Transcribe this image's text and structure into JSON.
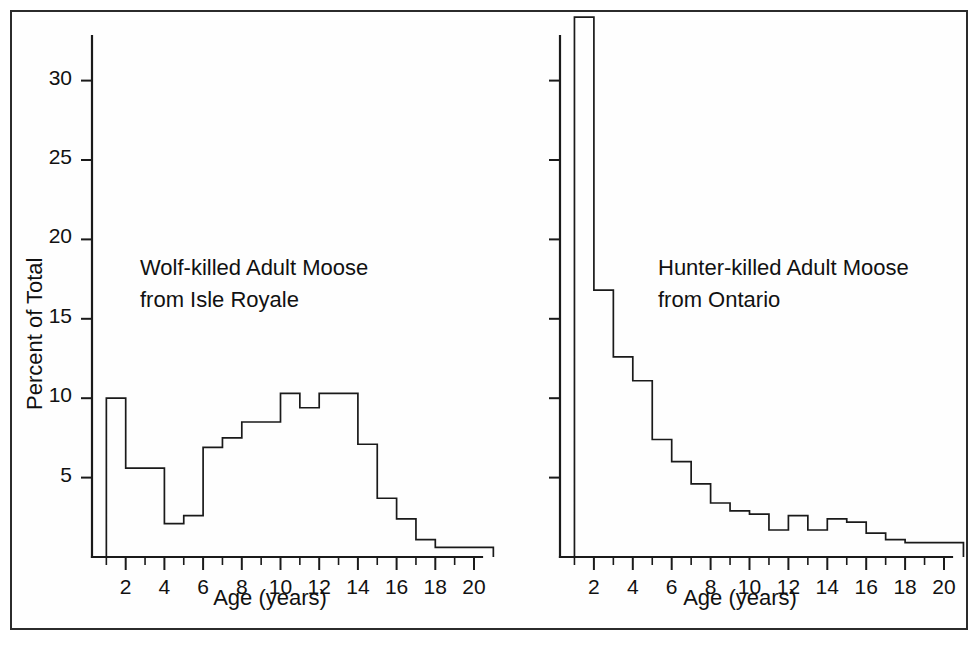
{
  "figure": {
    "background": "#ffffff",
    "frame_color": "#2b2b2b",
    "line_color": "#1a1a1a"
  },
  "chart_data": [
    {
      "type": "bar",
      "id": "wolf-killed-isle-royale",
      "title": "Wolf-killed Adult Moose from Isle Royale",
      "annotation_line1": "Wolf-killed Adult Moose",
      "annotation_line2": "from Isle Royale",
      "xlabel": "Age (years)",
      "ylabel": "Percent of Total",
      "xlim": [
        0,
        20
      ],
      "ylim": [
        0,
        34
      ],
      "grid": false,
      "legend": "none",
      "bin_width": 1,
      "xtick_labels": [
        "2",
        "4",
        "6",
        "8",
        "10",
        "12",
        "14",
        "16",
        "18",
        "20"
      ],
      "xtick_values": [
        2,
        4,
        6,
        8,
        10,
        12,
        14,
        16,
        18,
        20
      ],
      "xtick_minor_values": [
        1,
        3,
        5,
        7,
        9,
        11,
        13,
        15,
        17,
        19
      ],
      "ytick_labels": [
        "5",
        "10",
        "15",
        "20",
        "25",
        "30"
      ],
      "ytick_values": [
        5,
        10,
        15,
        20,
        25,
        30
      ],
      "categories": [
        1,
        2,
        3,
        4,
        5,
        6,
        7,
        8,
        9,
        10,
        11,
        12,
        13,
        14,
        15,
        16,
        17,
        18,
        19,
        20
      ],
      "bin_starts": [
        1,
        2,
        3,
        4,
        5,
        6,
        7,
        8,
        9,
        10,
        11,
        12,
        13,
        14,
        15,
        16,
        17,
        18,
        19,
        20
      ],
      "values": [
        10.0,
        5.6,
        5.6,
        2.1,
        2.6,
        6.9,
        7.5,
        8.5,
        8.5,
        10.3,
        9.4,
        10.3,
        10.3,
        7.1,
        3.7,
        2.4,
        1.1,
        0.6,
        0.6,
        0.6
      ]
    },
    {
      "type": "bar",
      "id": "hunter-killed-ontario",
      "title": "Hunter-killed Adult Moose from Ontario",
      "annotation_line1": "Hunter-killed Adult Moose",
      "annotation_line2": "from Ontario",
      "xlabel": "Age (years)",
      "ylabel": "",
      "xlim": [
        0,
        20
      ],
      "ylim": [
        0,
        34
      ],
      "grid": false,
      "legend": "none",
      "bin_width": 1,
      "xtick_labels": [
        "2",
        "4",
        "6",
        "8",
        "10",
        "12",
        "14",
        "16",
        "18",
        "20"
      ],
      "xtick_values": [
        2,
        4,
        6,
        8,
        10,
        12,
        14,
        16,
        18,
        20
      ],
      "xtick_minor_values": [
        1,
        3,
        5,
        7,
        9,
        11,
        13,
        15,
        17,
        19
      ],
      "ytick_labels": [],
      "ytick_values": [
        5,
        10,
        15,
        20,
        25,
        30
      ],
      "categories": [
        1,
        2,
        3,
        4,
        5,
        6,
        7,
        8,
        9,
        10,
        11,
        12,
        13,
        14,
        15,
        16,
        17,
        18,
        19,
        20
      ],
      "bin_starts": [
        1,
        2,
        3,
        4,
        5,
        6,
        7,
        8,
        9,
        10,
        11,
        12,
        13,
        14,
        15,
        16,
        17,
        18,
        19,
        20
      ],
      "values": [
        34.0,
        16.8,
        12.6,
        11.1,
        7.4,
        6.0,
        4.6,
        3.4,
        2.9,
        2.7,
        1.7,
        2.6,
        1.7,
        2.4,
        2.2,
        1.5,
        1.1,
        0.9,
        0.9,
        0.9
      ]
    }
  ]
}
